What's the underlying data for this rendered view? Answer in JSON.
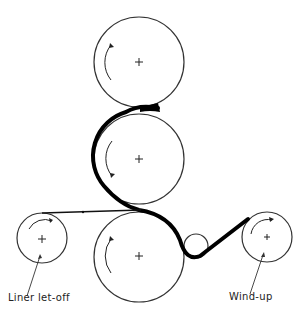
{
  "diagram": {
    "labels": {
      "liner_let_off": "Liner  let-off",
      "wind_up": "Wind-up"
    },
    "rolls": [
      {
        "id": "top-calender-roll",
        "cx": 139,
        "cy": 62,
        "r": 45
      },
      {
        "id": "middle-calender-roll",
        "cx": 139,
        "cy": 159,
        "r": 45
      },
      {
        "id": "bottom-calender-roll",
        "cx": 139,
        "cy": 257,
        "r": 45
      },
      {
        "id": "liner-let-off-roll",
        "cx": 42,
        "cy": 238,
        "r": 25
      },
      {
        "id": "idler-roll",
        "cx": 196,
        "cy": 246,
        "r": 12
      },
      {
        "id": "wind-up-roll",
        "cx": 267,
        "cy": 237,
        "r": 25
      }
    ],
    "colors": {
      "line": "#333333",
      "web": "#000000",
      "background": "#ffffff"
    }
  }
}
